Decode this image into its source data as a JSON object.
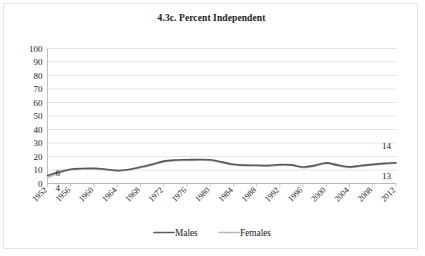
{
  "chart_data": {
    "type": "line",
    "title": "4.3c. Percent Independent",
    "xlabel": "",
    "ylabel": "",
    "ylim": [
      0,
      100
    ],
    "ytick_step": 10,
    "yticks": [
      "0",
      "10",
      "20",
      "30",
      "40",
      "50",
      "60",
      "70",
      "80",
      "90",
      "100"
    ],
    "grid": true,
    "legend_position": "bottom",
    "x": [
      1952,
      1954,
      1956,
      1958,
      1960,
      1962,
      1964,
      1966,
      1968,
      1970,
      1972,
      1974,
      1976,
      1978,
      1980,
      1982,
      1984,
      1986,
      1988,
      1990,
      1992,
      1994,
      1996,
      1998,
      2000,
      2002,
      2004,
      2006,
      2008,
      2010,
      2012
    ],
    "tick_labels": [
      "1952",
      "1956",
      "1960",
      "1964",
      "1968",
      "1972",
      "1976",
      "1980",
      "1984",
      "1988",
      "1992",
      "1996",
      "2000",
      "2004",
      "2008",
      "2012"
    ],
    "series": [
      {
        "name": "Males",
        "color": "#5a5a5a",
        "values": [
          6,
          8.5,
          10.6,
          11.1,
          11.2,
          10.6,
          9.6,
          10.4,
          12.2,
          14.2,
          16.6,
          17.4,
          17.6,
          17.8,
          17.6,
          16.0,
          14.2,
          13.6,
          13.5,
          13.4,
          14.0,
          13.8,
          12.2,
          13.4,
          15.3,
          13.6,
          12.3,
          13.3,
          14.2,
          14.9,
          15.4
        ],
        "start_label": "6",
        "end_label": "14"
      },
      {
        "name": "Females",
        "color": "#b6b6b6",
        "values": [
          4.4,
          7.8,
          10.2,
          10.9,
          11.0,
          10.3,
          9.2,
          10.0,
          11.7,
          13.6,
          16.0,
          16.9,
          17.1,
          17.2,
          17.0,
          15.4,
          13.7,
          13.1,
          13.0,
          12.9,
          13.5,
          13.3,
          11.7,
          12.9,
          14.8,
          13.1,
          11.8,
          12.8,
          13.7,
          14.4,
          14.9
        ],
        "start_label": "4",
        "end_label": "13"
      }
    ],
    "data_labels": {
      "males_start": "6",
      "females_start": "4",
      "males_end": "14",
      "females_end": "13"
    }
  },
  "legend": {
    "items": [
      {
        "label": "Males"
      },
      {
        "label": "Females"
      }
    ]
  }
}
